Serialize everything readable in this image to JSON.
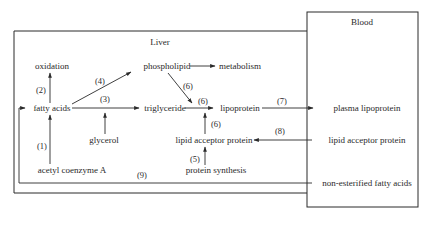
{
  "regions": {
    "liver": "Liver",
    "blood": "Blood"
  },
  "nodes": {
    "oxidation": "oxidation",
    "fatty_acids": "fatty acids",
    "phospholipid": "phospholipid",
    "metabolism": "metabolism",
    "triglyceride": "triglyceride",
    "lipoprotein": "lipoprotein",
    "glycerol": "glycerol",
    "lipid_acceptor_protein_liver": "lipid acceptor protein",
    "protein_synthesis": "protein synthesis",
    "acetyl_coenzyme_a": "acetyl coenzyme A",
    "plasma_lipoprotein": "plasma lipoprotein",
    "lipid_acceptor_protein_blood": "lipid acceptor protein",
    "nefa": "non-esterified fatty acids"
  },
  "steps": {
    "s1": "(1)",
    "s2": "(2)",
    "s3": "(3)",
    "s4": "(4)",
    "s5": "(5)",
    "s6a": "(6)",
    "s6b": "(6)",
    "s6c": "(6)",
    "s7": "(7)",
    "s8": "(8)",
    "s9": "(9)"
  }
}
